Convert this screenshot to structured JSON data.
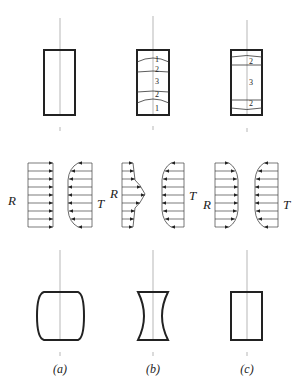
{
  "figure": {
    "columns": [
      {
        "id": "a",
        "caption": "(a)",
        "initial_shape": "rectangle",
        "zones": [],
        "friction_labels": {
          "left": "R",
          "right": "T"
        },
        "R_profile": "uniform",
        "T_profile": "convex",
        "final_shape": "barrel"
      },
      {
        "id": "b",
        "caption": "(b)",
        "initial_shape": "rectangle",
        "zones": [
          "1",
          "2",
          "3",
          "2",
          "1"
        ],
        "friction_labels": {
          "left": "R",
          "right": "T"
        },
        "R_profile": "peaked",
        "T_profile": "convex",
        "final_shape": "hourglass"
      },
      {
        "id": "c",
        "caption": "(c)",
        "initial_shape": "rectangle",
        "zones": [
          "2",
          "3",
          "2"
        ],
        "friction_labels": {
          "left": "R",
          "right": "T"
        },
        "R_profile": "convex",
        "T_profile": "convex",
        "final_shape": "rectangle"
      }
    ],
    "colors": {
      "stroke": "#222222",
      "axis": "#999999",
      "background": "#ffffff"
    }
  }
}
